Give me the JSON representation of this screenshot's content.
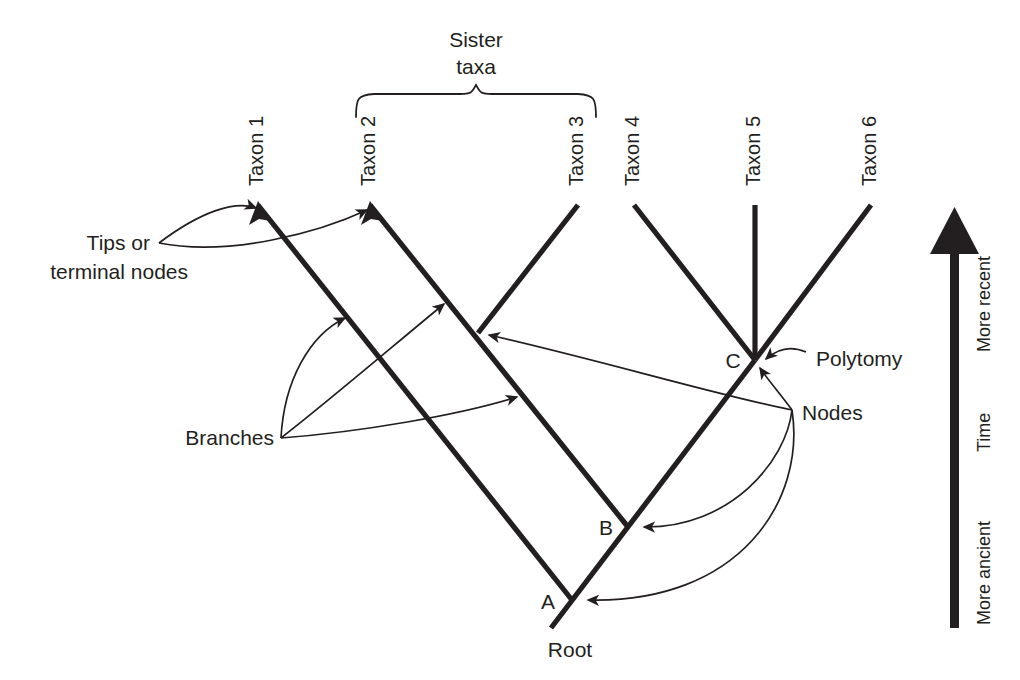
{
  "figure": {
    "kind": "phylogenetic-tree-diagram",
    "background_color": "#ffffff",
    "ink_color": "#231f20",
    "branch_color": "#231f20"
  },
  "taxa": [
    {
      "id": "taxon-1",
      "label": "Taxon 1"
    },
    {
      "id": "taxon-2",
      "label": "Taxon 2"
    },
    {
      "id": "taxon-3",
      "label": "Taxon 3"
    },
    {
      "id": "taxon-4",
      "label": "Taxon 4"
    },
    {
      "id": "taxon-5",
      "label": "Taxon 5"
    },
    {
      "id": "taxon-6",
      "label": "Taxon 6"
    }
  ],
  "nodes": [
    {
      "id": "node-a",
      "label": "A"
    },
    {
      "id": "node-b",
      "label": "B"
    },
    {
      "id": "node-c",
      "label": "C"
    }
  ],
  "annotations": {
    "sister_taxa": "Sister\ntaxa",
    "sister_taxa_line1": "Sister",
    "sister_taxa_line2": "taxa",
    "tips_line1": "Tips or",
    "tips_line2": "terminal nodes",
    "branches": "Branches",
    "nodes": "Nodes",
    "polytomy": "Polytomy",
    "root": "Root"
  },
  "time_axis": {
    "top_label": "More recent",
    "middle_label": "Time",
    "bottom_label": "More ancient",
    "direction": "upward"
  }
}
